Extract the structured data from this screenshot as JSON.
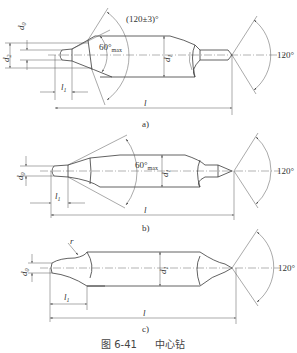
{
  "figure": {
    "number": "图 6-41",
    "title": "中心钻",
    "views": [
      {
        "id": "a",
        "label": "a)",
        "dimensions": {
          "d0": "d",
          "d0_sub": "0",
          "d2": "d",
          "d2_sub": "2",
          "d1": "d",
          "d1_sub": "1",
          "l1": "l",
          "l1_sub": "1",
          "l": "l",
          "cone_angle": "60°",
          "cone_angle_sub": "max",
          "chamfer_angle": "(120±3)°",
          "point_angle": "120°"
        }
      },
      {
        "id": "b",
        "label": "b)",
        "dimensions": {
          "d0": "d",
          "d0_sub": "0",
          "d1": "d",
          "d1_sub": "1",
          "l1": "l",
          "l1_sub": "1",
          "l": "l",
          "cone_angle": "60°",
          "cone_angle_sub": "max",
          "point_angle": "120°"
        }
      },
      {
        "id": "c",
        "label": "c)",
        "dimensions": {
          "r": "r",
          "d0": "d",
          "d0_sub": "0",
          "d1": "d",
          "d1_sub": "1",
          "l1": "l",
          "l1_sub": "1",
          "l": "l",
          "point_angle": "120°"
        }
      }
    ]
  }
}
